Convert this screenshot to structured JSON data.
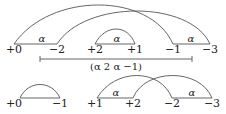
{
  "top_row": {
    "nodes": [
      {
        "label": "+0",
        "x": 14
      },
      {
        "label": "−2",
        "x": 57
      },
      {
        "label": "+2",
        "x": 95
      },
      {
        "label": "+1",
        "x": 135
      },
      {
        "label": "−1",
        "x": 173
      },
      {
        "label": "−3",
        "x": 210
      }
    ],
    "edge_labels": [
      "α",
      "α",
      "α"
    ],
    "bracket_label": "(α 2 α −1)"
  },
  "bottom_row": {
    "nodes": [
      {
        "label": "+0",
        "x": 14
      },
      {
        "label": "−1",
        "x": 60
      },
      {
        "label": "+1",
        "x": 95
      },
      {
        "label": "+2",
        "x": 133
      },
      {
        "label": "−2",
        "x": 172
      },
      {
        "label": "−3",
        "x": 212
      }
    ],
    "edge_labels": [
      "α",
      "α"
    ]
  },
  "colors": {
    "stroke": "#555555",
    "text": "#222222"
  }
}
